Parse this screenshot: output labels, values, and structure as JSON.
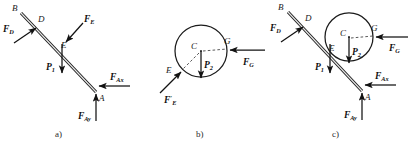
{
  "figure": {
    "background_color": "#ffffff",
    "ink_color": "#1b1b1b",
    "panels": [
      {
        "id": "a",
        "caption": "a)",
        "description": "Free-body diagram of the inclined rod AB",
        "points": [
          {
            "name": "B",
            "label": "B"
          },
          {
            "name": "D",
            "label": "D"
          },
          {
            "name": "E",
            "label": "E"
          },
          {
            "name": "A",
            "label": "A"
          }
        ],
        "forces": [
          {
            "name": "F_D",
            "base": "F",
            "sub": "D",
            "prime": false,
            "direction": "up-right"
          },
          {
            "name": "F_E",
            "base": "F",
            "sub": "E",
            "prime": false,
            "direction": "down-left"
          },
          {
            "name": "P_1",
            "base": "P",
            "sub": "1",
            "prime": false,
            "direction": "down"
          },
          {
            "name": "F_Ax",
            "base": "F",
            "sub": "Ax",
            "prime": false,
            "direction": "left"
          },
          {
            "name": "F_Ay",
            "base": "F",
            "sub": "Ay",
            "prime": false,
            "direction": "up"
          }
        ]
      },
      {
        "id": "b",
        "caption": "b)",
        "description": "Free-body diagram of the circular disk with center C",
        "points": [
          {
            "name": "C",
            "label": "C"
          },
          {
            "name": "G",
            "label": "G"
          },
          {
            "name": "E",
            "label": "E"
          }
        ],
        "forces": [
          {
            "name": "P_2",
            "base": "P",
            "sub": "2",
            "prime": false,
            "direction": "down"
          },
          {
            "name": "F_G",
            "base": "F",
            "sub": "G",
            "prime": false,
            "direction": "left"
          },
          {
            "name": "F_E_prime",
            "base": "F",
            "sub": "E",
            "prime": true,
            "direction": "up-right"
          }
        ]
      },
      {
        "id": "c",
        "caption": "c)",
        "description": "Combined free-body diagram of rod and disk",
        "points": [
          {
            "name": "B",
            "label": "B"
          },
          {
            "name": "D",
            "label": "D"
          },
          {
            "name": "C",
            "label": "C"
          },
          {
            "name": "G",
            "label": "G"
          },
          {
            "name": "E",
            "label": "E"
          },
          {
            "name": "A",
            "label": "A"
          }
        ],
        "forces": [
          {
            "name": "F_D",
            "base": "F",
            "sub": "D",
            "prime": false,
            "direction": "up-right"
          },
          {
            "name": "P_1",
            "base": "P",
            "sub": "1",
            "prime": false,
            "direction": "down"
          },
          {
            "name": "P_2",
            "base": "P",
            "sub": "2",
            "prime": false,
            "direction": "down"
          },
          {
            "name": "F_G",
            "base": "F",
            "sub": "G",
            "prime": false,
            "direction": "left"
          },
          {
            "name": "F_Ax",
            "base": "F",
            "sub": "Ax",
            "prime": false,
            "direction": "left"
          },
          {
            "name": "F_Ay",
            "base": "F",
            "sub": "Ay",
            "prime": false,
            "direction": "up"
          }
        ]
      }
    ],
    "labels": {
      "B": "B",
      "D": "D",
      "E": "E",
      "A": "A",
      "C": "C",
      "G": "G",
      "F": "F",
      "P": "P",
      "prime": "′",
      "sub_D": "D",
      "sub_E": "E",
      "sub_G": "G",
      "sub_1": "1",
      "sub_2": "2",
      "sub_Ax": "Ax",
      "sub_Ay": "Ay",
      "cap_a": "a)",
      "cap_b": "b)",
      "cap_c": "c)"
    }
  }
}
